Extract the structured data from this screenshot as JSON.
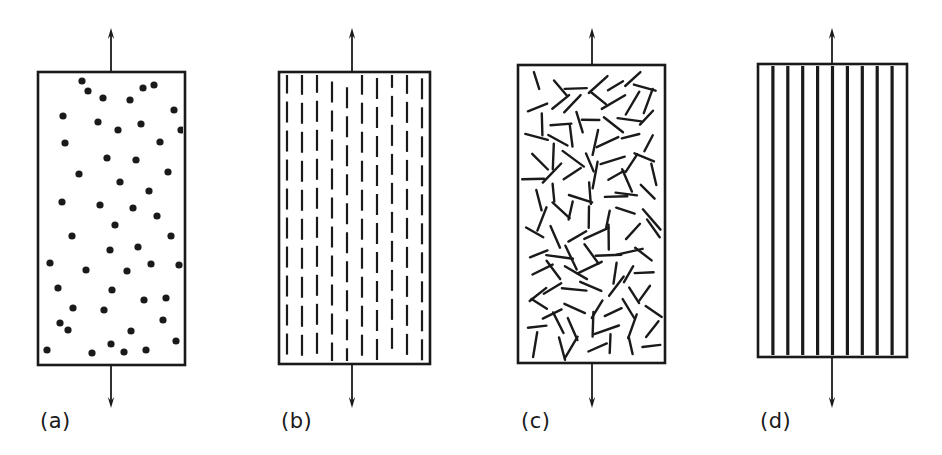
{
  "figure": {
    "name": "composite-reinforcement-schematic",
    "background_color": "#ffffff",
    "ink_color": "#1a1a1a",
    "width": 942,
    "height": 455
  },
  "panels": [
    {
      "id": "a",
      "label": "(a)",
      "label_x": 40,
      "label_y": 428,
      "reinforcement": "randomly-dispersed-particles",
      "box": {
        "x": 38,
        "y": 72,
        "w": 147,
        "h": 293
      },
      "arrow_x": 111,
      "arrow_top_y": 28,
      "arrow_bottom_y": 408,
      "particle_radius": 3.6,
      "particles": [
        [
          47,
          350
        ],
        [
          50,
          263
        ],
        [
          58,
          288
        ],
        [
          62,
          202
        ],
        [
          63,
          116
        ],
        [
          65,
          143
        ],
        [
          68,
          330
        ],
        [
          72,
          236
        ],
        [
          73,
          308
        ],
        [
          79,
          174
        ],
        [
          82,
          81
        ],
        [
          86,
          270
        ],
        [
          92,
          353
        ],
        [
          98,
          122
        ],
        [
          100,
          205
        ],
        [
          103,
          98
        ],
        [
          104,
          310
        ],
        [
          107,
          158
        ],
        [
          110,
          250
        ],
        [
          111,
          344
        ],
        [
          112,
          290
        ],
        [
          115,
          225
        ],
        [
          118,
          130
        ],
        [
          120,
          182
        ],
        [
          124,
          352
        ],
        [
          127,
          271
        ],
        [
          130,
          100
        ],
        [
          131,
          331
        ],
        [
          133,
          208
        ],
        [
          136,
          160
        ],
        [
          138,
          247
        ],
        [
          141,
          124
        ],
        [
          144,
          300
        ],
        [
          146,
          350
        ],
        [
          149,
          191
        ],
        [
          151,
          264
        ],
        [
          154,
          85
        ],
        [
          157,
          216
        ],
        [
          160,
          142
        ],
        [
          163,
          320
        ],
        [
          166,
          298
        ],
        [
          168,
          172
        ],
        [
          171,
          236
        ],
        [
          174,
          110
        ],
        [
          176,
          341
        ],
        [
          179,
          265
        ],
        [
          181,
          130
        ],
        [
          60,
          323
        ],
        [
          88,
          91
        ],
        [
          143,
          88
        ]
      ]
    },
    {
      "id": "b",
      "label": "(b)",
      "label_x": 281,
      "label_y": 428,
      "reinforcement": "aligned-discontinuous-short-fibers",
      "box": {
        "x": 279,
        "y": 72,
        "w": 151,
        "h": 292
      },
      "arrow_x": 352,
      "arrow_top_y": 28,
      "arrow_bottom_y": 408,
      "dash_columns": 10,
      "dash_length": 21,
      "dash_gap": 8,
      "column_spacing": 15,
      "stroke_width": 2.2
    },
    {
      "id": "c",
      "label": "(c)",
      "label_x": 521,
      "label_y": 428,
      "reinforcement": "randomly-oriented-short-fibers",
      "box": {
        "x": 518,
        "y": 65,
        "w": 147,
        "h": 298
      },
      "arrow_x": 592,
      "arrow_top_y": 28,
      "arrow_bottom_y": 408,
      "fiber_count": 120,
      "fiber_length": 22,
      "stroke_width": 2.4
    },
    {
      "id": "d",
      "label": "(d)",
      "label_x": 760,
      "label_y": 428,
      "reinforcement": "continuous-aligned-fibers",
      "box": {
        "x": 758,
        "y": 64,
        "w": 149,
        "h": 293
      },
      "arrow_x": 832,
      "arrow_top_y": 28,
      "arrow_bottom_y": 408,
      "fiber_lines": 9,
      "stroke_width": 3.2
    }
  ]
}
